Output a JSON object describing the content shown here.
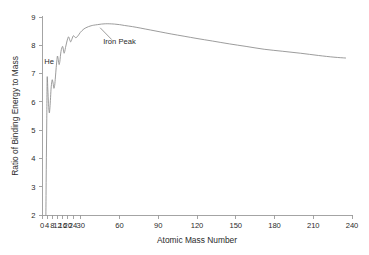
{
  "chart_data": {
    "type": "line",
    "title": "",
    "xlabel": "Atomic Mass Number",
    "ylabel": "Ratio of Binding Energy to Mass",
    "xlim": [
      0,
      240
    ],
    "ylim": [
      2,
      9
    ],
    "grid": false,
    "legend": null,
    "xticks": [
      0,
      4,
      8,
      12,
      16,
      20,
      24,
      30,
      60,
      90,
      120,
      150,
      180,
      210,
      240
    ],
    "xticklabels": [
      "0",
      "4",
      "8",
      "12",
      "16",
      "20",
      "24",
      "30",
      "60",
      "90",
      "120",
      "150",
      "180",
      "210",
      "240"
    ],
    "yticks": [
      2,
      3,
      4,
      5,
      6,
      7,
      8,
      9
    ],
    "yticklabels": [
      "2",
      "3",
      "4",
      "5",
      "6",
      "7",
      "8",
      "9"
    ],
    "series": [
      {
        "name": "Binding energy per nucleon",
        "color": "#8a8a8a",
        "x": [
          3.0,
          3.3,
          3.7,
          4.0,
          4.5,
          5.0,
          5.6,
          6.0,
          6.5,
          7.0,
          7.6,
          8.0,
          8.6,
          9.2,
          9.8,
          10.4,
          11.0,
          11.6,
          12.0,
          12.6,
          13.2,
          13.8,
          14.2,
          14.7,
          15.3,
          16.0,
          16.6,
          17.1,
          17.6,
          18.2,
          19.0,
          19.8,
          20.6,
          21.4,
          22.2,
          23.0,
          23.8,
          24.4,
          25.2,
          26.2,
          27.2,
          28.4,
          29.6,
          31.0,
          32.5,
          34.0,
          36.0,
          38.0,
          40.0,
          43.0,
          46.0,
          49.0,
          52.0,
          56.0,
          60.0,
          64.0,
          70.0,
          76.0,
          84.0,
          92.0,
          100.0,
          110.0,
          120.0,
          132.0,
          145.0,
          158.0,
          172.0,
          186.0,
          200.0,
          214.0,
          226.0,
          235.0
        ],
        "y": [
          2.0,
          3.6,
          5.4,
          6.85,
          6.45,
          5.95,
          5.62,
          5.72,
          6.05,
          6.45,
          6.72,
          6.78,
          6.66,
          6.48,
          6.58,
          6.88,
          7.22,
          7.5,
          7.62,
          7.5,
          7.32,
          7.42,
          7.6,
          7.78,
          7.9,
          7.96,
          7.83,
          7.72,
          7.78,
          7.92,
          8.08,
          8.22,
          8.3,
          8.2,
          8.12,
          8.2,
          8.3,
          8.34,
          8.3,
          8.27,
          8.3,
          8.37,
          8.45,
          8.52,
          8.58,
          8.62,
          8.66,
          8.69,
          8.71,
          8.73,
          8.75,
          8.76,
          8.76,
          8.75,
          8.73,
          8.7,
          8.66,
          8.61,
          8.54,
          8.47,
          8.4,
          8.32,
          8.24,
          8.15,
          8.05,
          7.96,
          7.86,
          7.79,
          7.72,
          7.64,
          7.58,
          7.55
        ]
      }
    ],
    "annotations": [
      {
        "name": "he-annotation",
        "text": "He",
        "x": 5.5,
        "y": 7.35,
        "leader": null
      },
      {
        "name": "iron-peak-annotation",
        "text": "Iron Peak",
        "x": 60,
        "y": 8.05,
        "leader": {
          "x1": 54,
          "y1": 8.2,
          "x2": 45,
          "y2": 8.62
        }
      }
    ]
  }
}
